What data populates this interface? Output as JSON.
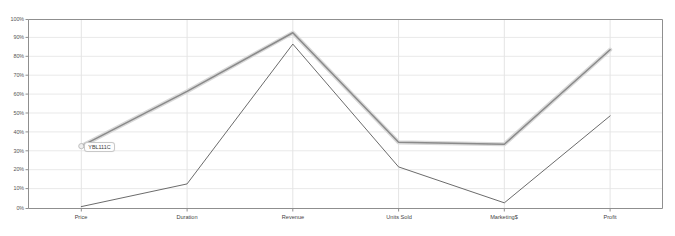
{
  "chart_data": {
    "type": "line",
    "title": "",
    "xlabel": "",
    "ylabel": "",
    "categories": [
      "Price",
      "Duration",
      "Revenue",
      "Units Sold",
      "Marketing$",
      "Profit"
    ],
    "series": [
      {
        "name": "highlighted",
        "color": "#8a8a8a",
        "halo_color": "#d9d9d9",
        "values": [
          33,
          62,
          93,
          35,
          34,
          84
        ]
      },
      {
        "name": "secondary",
        "color": "#5a5a5a",
        "halo_color": "",
        "values": [
          1,
          13,
          87,
          22,
          3,
          49
        ]
      }
    ],
    "ylim": [
      0,
      100
    ],
    "yticks": [
      0,
      10,
      20,
      30,
      40,
      50,
      60,
      70,
      80,
      90,
      100
    ],
    "ytick_labels": [
      "0%",
      "10%",
      "20%",
      "30%",
      "40%",
      "50%",
      "60%",
      "70%",
      "80%",
      "90%",
      "100%"
    ],
    "grid": true,
    "legend": "none",
    "annotations": [
      {
        "text": "YBL111C",
        "series": "highlighted",
        "category": "Price",
        "value": 33
      }
    ]
  },
  "axes": {
    "y_tick_0": "0%",
    "y_tick_1": "10%",
    "y_tick_2": "20%",
    "y_tick_3": "30%",
    "y_tick_4": "40%",
    "y_tick_5": "50%",
    "y_tick_6": "60%",
    "y_tick_7": "70%",
    "y_tick_8": "80%",
    "y_tick_9": "90%",
    "y_tick_10": "100%",
    "x_tick_0": "Price",
    "x_tick_1": "Duration",
    "x_tick_2": "Revenue",
    "x_tick_3": "Units Sold",
    "x_tick_4": "Marketing$",
    "x_tick_5": "Profit"
  },
  "tooltip": {
    "label": "YBL111C"
  },
  "colors": {
    "axis": "#8f8f8f",
    "grid": "#e6e6e6",
    "series_highlight": "#8a8a8a",
    "series_highlight_halo": "#d9d9d9",
    "series_secondary": "#5a5a5a",
    "background": "#ffffff",
    "tick_text": "#555555"
  }
}
